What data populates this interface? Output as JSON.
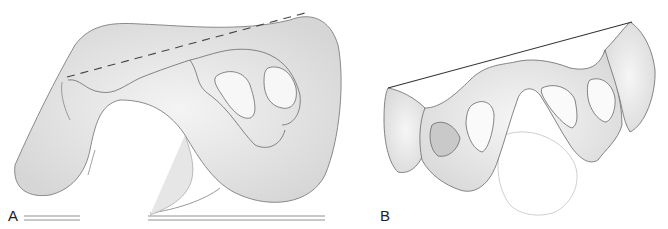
{
  "figure": {
    "panels": [
      {
        "id": "A",
        "label": "A",
        "description": "Lateral view of pelvis drawing with dashed reference line"
      },
      {
        "id": "B",
        "label": "B",
        "description": "Oblique view of pelvis drawing with solid reference line"
      }
    ],
    "colors": {
      "ink": "#555555",
      "shade": "#d8d8d8",
      "background": "#ffffff"
    }
  }
}
